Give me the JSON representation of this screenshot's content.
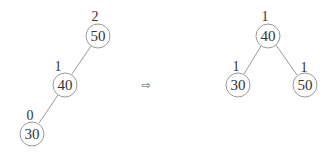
{
  "diagram": {
    "before": {
      "nodes": [
        {
          "value": "50",
          "height": "2"
        },
        {
          "value": "40",
          "height": "1"
        },
        {
          "value": "30",
          "height": "0"
        }
      ]
    },
    "arrow": "⇨",
    "after": {
      "nodes": [
        {
          "value": "40",
          "height": "1"
        },
        {
          "value": "30",
          "height": "1"
        },
        {
          "value": "50",
          "height": "1"
        }
      ]
    }
  }
}
